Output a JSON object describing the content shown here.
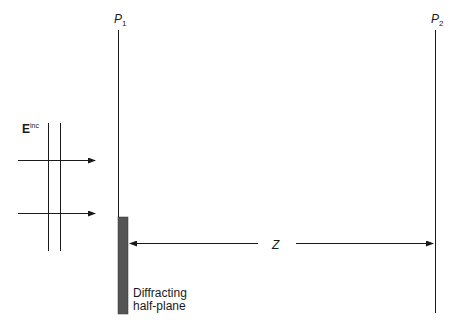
{
  "diagram": {
    "labels": {
      "p1_main": "P",
      "p1_sub": "1",
      "p2_main": "P",
      "p2_sub": "2",
      "e_main": "E",
      "e_sup": "inc",
      "distance": "Z",
      "plane_line1": "Diffracting",
      "plane_line2": "half-plane"
    },
    "colors": {
      "line": "#1a1a1a",
      "half_plane_fill": "#555555"
    }
  }
}
